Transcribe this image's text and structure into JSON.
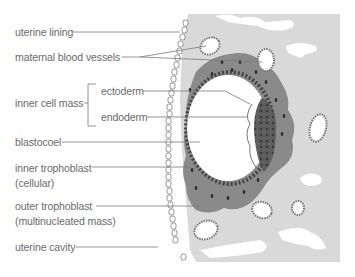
{
  "diagram": {
    "type": "anatomical-illustration",
    "colors": {
      "background": "#ffffff",
      "tissue_light": "#d9d9d9",
      "trophoblast_outer": "#8a8a8a",
      "inner_cell_mass": "#5c5c5c",
      "blastocoel": "#ffffff",
      "label_text": "#6a6a6a",
      "leader_line": "#7a7a7a"
    },
    "labels": [
      {
        "id": "uterine-lining",
        "text": "uterine lining"
      },
      {
        "id": "maternal-blood-vessels",
        "text": "maternal blood vessels"
      },
      {
        "id": "inner-cell-mass",
        "text": "inner cell mass"
      },
      {
        "id": "ectoderm",
        "text": "ectoderm"
      },
      {
        "id": "endoderm",
        "text": "endoderm"
      },
      {
        "id": "blastocoel",
        "text": "blastocoel"
      },
      {
        "id": "inner-trophoblast",
        "text": "inner trophoblast",
        "sub": "(cellular)"
      },
      {
        "id": "outer-trophoblast",
        "text": "outer trophoblast",
        "sub": "(multinucleated mass)"
      },
      {
        "id": "uterine-cavity",
        "text": "uterine cavity"
      }
    ]
  }
}
